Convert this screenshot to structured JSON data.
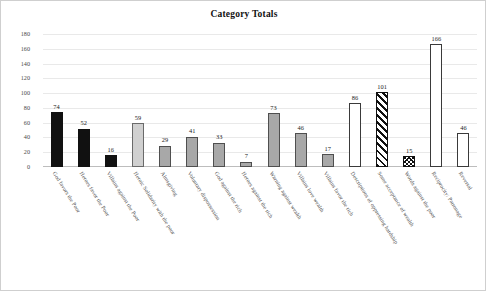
{
  "chart_data": {
    "type": "bar",
    "title": "Category Totals",
    "xlabel": "",
    "ylabel": "",
    "ylim": [
      0,
      180
    ],
    "yticks": [
      0,
      20,
      40,
      60,
      80,
      100,
      120,
      140,
      160,
      180
    ],
    "grid": true,
    "legend": "none",
    "categories": [
      "God favors the Poor",
      "Heroes favor the Poor",
      "Villains against the Poor",
      "Heroic Solidarity with the poor",
      "Almsgiving",
      "Voluntary dispossession",
      "God against the rich",
      "Heroes against the rich",
      "Warning against wealth",
      "Villains love wealth",
      "Villains favor the rich",
      "Descriptions of oppressing hardship",
      "Some acceptance of wealth",
      "Words against the poor",
      "Reciprocity/ Patronage",
      "Reversal"
    ],
    "values": [
      74,
      52,
      16,
      59,
      29,
      41,
      33,
      7,
      73,
      46,
      17,
      86,
      101,
      15,
      166,
      46
    ],
    "bar_styles": [
      "fill-black",
      "fill-black",
      "fill-black",
      "fill-ltgray",
      "fill-gray",
      "fill-gray",
      "fill-gray",
      "fill-gray",
      "fill-gray",
      "fill-gray",
      "fill-gray",
      "fill-white",
      "fill-stripe",
      "fill-crosshatch",
      "fill-white",
      "fill-white"
    ],
    "colors": {
      "black": "#111111",
      "gray": "#a8a8a8",
      "light_gray": "#d0d0d0",
      "white": "#ffffff",
      "outline": "#3a3a3a",
      "gridline": "#e9e9e9"
    }
  }
}
